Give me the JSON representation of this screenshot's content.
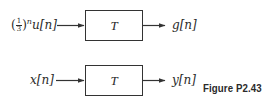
{
  "figure": {
    "caption": "Figure P2.43",
    "systems": [
      {
        "input_label": "(1/3)^n u[n]",
        "input_parts": {
          "open": "(",
          "frac_num": "1",
          "frac_den": "3",
          "close": ")",
          "exp": "n",
          "rest": "u[n]"
        },
        "block_label": "T",
        "output_label": "g[n]"
      },
      {
        "input_label": "x[n]",
        "block_label": "T",
        "output_label": "y[n]"
      }
    ]
  },
  "colors": {
    "line": "#333333",
    "text": "#2a2a2a",
    "background": "#ffffff"
  }
}
